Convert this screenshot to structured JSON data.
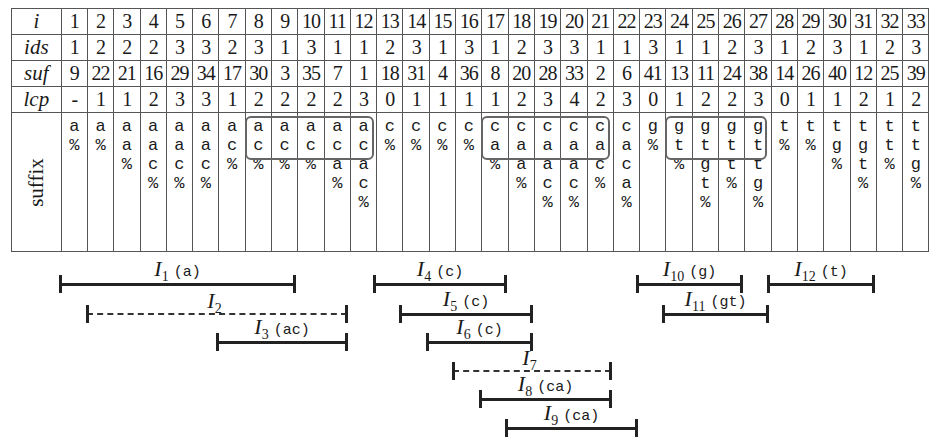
{
  "table": {
    "row_labels": {
      "i": "i",
      "ids": "ids",
      "suf": "suf",
      "lcp": "lcp",
      "suffix": "suffix"
    },
    "i": [
      "1",
      "2",
      "3",
      "4",
      "5",
      "6",
      "7",
      "8",
      "9",
      "10",
      "11",
      "12",
      "13",
      "14",
      "15",
      "16",
      "17",
      "18",
      "19",
      "20",
      "21",
      "22",
      "23",
      "24",
      "25",
      "26",
      "27",
      "28",
      "29",
      "30",
      "31",
      "32",
      "33"
    ],
    "ids": [
      "1",
      "2",
      "2",
      "2",
      "3",
      "3",
      "2",
      "3",
      "1",
      "3",
      "1",
      "1",
      "2",
      "3",
      "1",
      "3",
      "1",
      "2",
      "3",
      "3",
      "1",
      "1",
      "3",
      "1",
      "1",
      "2",
      "3",
      "1",
      "2",
      "3",
      "1",
      "2",
      "3"
    ],
    "suf": [
      "9",
      "22",
      "21",
      "16",
      "29",
      "34",
      "17",
      "30",
      "3",
      "35",
      "7",
      "1",
      "18",
      "31",
      "4",
      "36",
      "8",
      "20",
      "28",
      "33",
      "2",
      "6",
      "41",
      "13",
      "11",
      "24",
      "38",
      "14",
      "26",
      "40",
      "12",
      "25",
      "39"
    ],
    "lcp": [
      "-",
      "1",
      "1",
      "2",
      "3",
      "3",
      "1",
      "2",
      "2",
      "2",
      "2",
      "3",
      "0",
      "1",
      "1",
      "1",
      "1",
      "2",
      "3",
      "4",
      "2",
      "3",
      "0",
      "1",
      "2",
      "2",
      "3",
      "0",
      "1",
      "1",
      "2",
      "1",
      "2"
    ],
    "suffix": [
      [
        "a",
        "%"
      ],
      [
        "a",
        "%"
      ],
      [
        "a",
        "a",
        "%"
      ],
      [
        "a",
        "a",
        "c",
        "%"
      ],
      [
        "a",
        "a",
        "c",
        "%"
      ],
      [
        "a",
        "a",
        "c",
        "%"
      ],
      [
        "a",
        "c",
        "%"
      ],
      [
        "a",
        "c",
        "%"
      ],
      [
        "a",
        "c",
        "%"
      ],
      [
        "a",
        "c",
        "%"
      ],
      [
        "a",
        "c",
        "a",
        "%"
      ],
      [
        "a",
        "c",
        "a",
        "c",
        "%"
      ],
      [
        "c",
        "%"
      ],
      [
        "c",
        "%"
      ],
      [
        "c",
        "%"
      ],
      [
        "c",
        "%"
      ],
      [
        "c",
        "a",
        "%"
      ],
      [
        "c",
        "a",
        "a",
        "%"
      ],
      [
        "c",
        "a",
        "a",
        "c",
        "%"
      ],
      [
        "c",
        "a",
        "a",
        "c",
        "%"
      ],
      [
        "c",
        "a",
        "c",
        "%"
      ],
      [
        "c",
        "a",
        "c",
        "a",
        "%"
      ],
      [
        "g",
        "%"
      ],
      [
        "g",
        "t",
        "%"
      ],
      [
        "g",
        "t",
        "g",
        "t",
        "%"
      ],
      [
        "g",
        "t",
        "t",
        "%"
      ],
      [
        "g",
        "t",
        "t",
        "g",
        "%"
      ],
      [
        "t",
        "%"
      ],
      [
        "t",
        "%"
      ],
      [
        "t",
        "g",
        "%"
      ],
      [
        "t",
        "g",
        "t",
        "%"
      ],
      [
        "t",
        "t",
        "%"
      ],
      [
        "t",
        "t",
        "g",
        "%"
      ]
    ],
    "highlight_boxes": [
      {
        "from_col": 8,
        "to_col": 12,
        "rows": 2
      },
      {
        "from_col": 17,
        "to_col": 21,
        "rows": 2
      },
      {
        "from_col": 24,
        "to_col": 27,
        "rows": 2
      }
    ]
  },
  "intervals": [
    {
      "name": "I",
      "sub": "1",
      "chars": "(a)",
      "style": "solid"
    },
    {
      "name": "I",
      "sub": "2",
      "chars": "",
      "style": "dashed"
    },
    {
      "name": "I",
      "sub": "3",
      "chars": "(ac)",
      "style": "solid"
    },
    {
      "name": "I",
      "sub": "4",
      "chars": "(c)",
      "style": "solid"
    },
    {
      "name": "I",
      "sub": "5",
      "chars": "(c)",
      "style": "solid"
    },
    {
      "name": "I",
      "sub": "6",
      "chars": "(c)",
      "style": "solid"
    },
    {
      "name": "I",
      "sub": "7",
      "chars": "",
      "style": "dashed"
    },
    {
      "name": "I",
      "sub": "8",
      "chars": "(ca)",
      "style": "solid"
    },
    {
      "name": "I",
      "sub": "9",
      "chars": "(ca)",
      "style": "solid"
    },
    {
      "name": "I",
      "sub": "10",
      "chars": "(g)",
      "style": "solid"
    },
    {
      "name": "I",
      "sub": "11",
      "chars": "(gt)",
      "style": "solid"
    },
    {
      "name": "I",
      "sub": "12",
      "chars": "(t)",
      "style": "solid"
    }
  ]
}
